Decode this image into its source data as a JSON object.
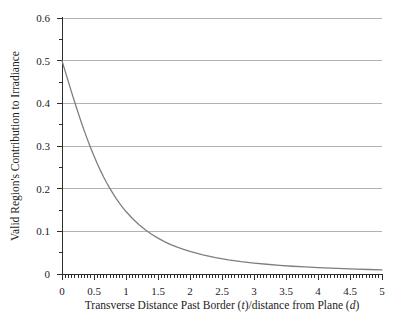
{
  "figure": {
    "background": "#ffffff",
    "ylabel": "Valid Region's Contribution to Irradiance",
    "xlabel_full": "Transverse Distance Past Border (t)/distance from Plane (d)",
    "xlabel_parts": {
      "p1": "Transverse Distance Past Border (",
      "p2": "t",
      "p3": ")/distance from Plane (",
      "p4": "d",
      "p5": ")"
    }
  },
  "chart_data": {
    "type": "line",
    "title": "",
    "xlabel": "Transverse Distance Past Border (t)/distance from Plane (d)",
    "ylabel": "Valid Region's Contribution to Irradiance",
    "xlim": [
      0,
      5
    ],
    "ylim": [
      0,
      0.6
    ],
    "xticks": {
      "values": [
        0,
        0.5,
        1,
        1.5,
        2,
        2.5,
        3,
        3.5,
        4,
        4.5,
        5
      ],
      "labels": [
        "0",
        "0.5",
        "1",
        "1.5",
        "2",
        "2.5",
        "3",
        "3.5",
        "4",
        "4.5",
        "5"
      ]
    },
    "yticks": {
      "values": [
        0,
        0.1,
        0.2,
        0.3,
        0.4,
        0.5,
        0.6
      ],
      "labels": [
        "0",
        "0.1",
        "0.2",
        "0.3",
        "0.4",
        "0.5",
        "0.6"
      ]
    },
    "minor_tick_step": 0.05,
    "gridlines_y": [
      0.1,
      0.2,
      0.3,
      0.4,
      0.5,
      0.6
    ],
    "grid": "horizontal",
    "legend": "none",
    "colors": {
      "curve": "#7e7e7e",
      "grid": "#b4b2ae",
      "axis": "#2e2e2e",
      "text": "#1c1c1c",
      "background": "#ffffff"
    },
    "series": [
      {
        "name": "valid-region-contribution",
        "x": [
          0,
          0.05,
          0.1,
          0.15,
          0.2,
          0.25,
          0.3,
          0.35,
          0.4,
          0.45,
          0.5,
          0.55,
          0.6,
          0.65,
          0.7,
          0.75,
          0.8,
          0.85,
          0.9,
          0.95,
          1.0,
          1.1,
          1.2,
          1.3,
          1.4,
          1.5,
          1.6,
          1.7,
          1.8,
          1.9,
          2.0,
          2.2,
          2.4,
          2.6,
          2.8,
          3.0,
          3.2,
          3.4,
          3.6,
          3.8,
          4.0,
          4.2,
          4.4,
          4.6,
          4.8,
          5.0
        ],
        "y": [
          0.5,
          0.475,
          0.4502,
          0.4258,
          0.4019,
          0.3787,
          0.3563,
          0.3348,
          0.3143,
          0.2948,
          0.2764,
          0.259,
          0.2428,
          0.2275,
          0.2133,
          0.2,
          0.1877,
          0.1762,
          0.1655,
          0.1556,
          0.1464,
          0.13,
          0.1159,
          0.1037,
          0.0931,
          0.084,
          0.076,
          0.069,
          0.0629,
          0.0575,
          0.0528,
          0.0448,
          0.0385,
          0.0333,
          0.0291,
          0.0257,
          0.0228,
          0.0203,
          0.0182,
          0.0165,
          0.0149,
          0.0136,
          0.0124,
          0.0114,
          0.0105,
          0.0097
        ]
      }
    ]
  }
}
